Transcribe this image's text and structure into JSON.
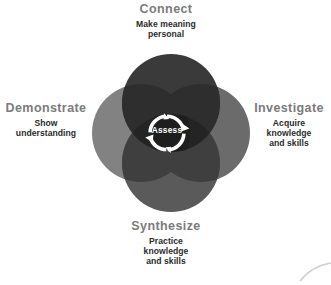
{
  "diagram": {
    "title_text": "Assess",
    "center_label": "Assess",
    "center_icon": "cycle-arrows-icon",
    "background_color": "#ffffff",
    "lobes": [
      {
        "id": "connect",
        "title": "Connect",
        "subtitle_lines": [
          "Make meaning",
          "personal"
        ],
        "position": "top",
        "color": "#3a3a3a"
      },
      {
        "id": "investigate",
        "title": "Investigate",
        "subtitle_lines": [
          "Acquire",
          "knowledge",
          "and skills"
        ],
        "position": "right",
        "color": "#6b6b6b"
      },
      {
        "id": "demonstrate",
        "title": "Demonstrate",
        "subtitle_lines": [
          "Show",
          "understanding"
        ],
        "position": "left",
        "color": "#828282"
      },
      {
        "id": "synthesize",
        "title": "Synthesize",
        "subtitle_lines": [
          "Practice",
          "knowledge",
          "and skills"
        ],
        "position": "bottom",
        "color": "#5a5a5a"
      }
    ],
    "colors": {
      "title_gray": "#7b7b7b",
      "subtitle_dark": "#2b2b2b",
      "overlap_dark": "#262626",
      "ring_white": "#ffffff",
      "corner_arc": "#cfcfcf"
    },
    "geometry": {
      "center_x": 171,
      "center_y": 133,
      "circle_radius": 49,
      "circle_offset": 30,
      "ring_radius": 17
    }
  }
}
